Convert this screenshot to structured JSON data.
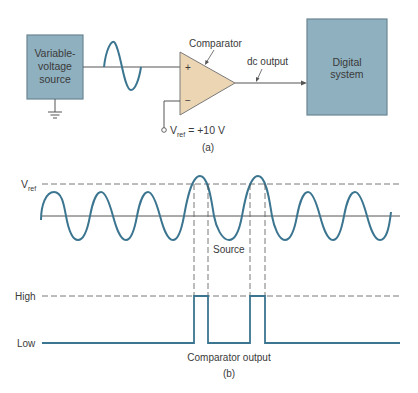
{
  "part_a": {
    "source_block": {
      "line1": "Variable-",
      "line2": "voltage",
      "line3": "source"
    },
    "comparator_label": "Comparator",
    "plus_sign": "+",
    "minus_sign": "−",
    "vref_label": {
      "v": "V",
      "sub": "ref",
      "value": "= +10 V"
    },
    "dc_output_label": "dc output",
    "digital_block": {
      "line1": "Digital",
      "line2": "system"
    },
    "caption": "(a)"
  },
  "part_b": {
    "vref_axis_label": {
      "v": "V",
      "sub": "ref"
    },
    "source_label": "Source",
    "high_label": "High",
    "low_label": "Low",
    "output_label": "Comparator output",
    "caption": "(b)"
  },
  "colors": {
    "block_fill": "#8fb0bf",
    "block_stroke": "#6a8593",
    "comparator_fill": "#ecd5b3",
    "comparator_stroke": "#7a7a7a",
    "wave": "#3b7590",
    "line": "#555555",
    "dashed": "#555555"
  }
}
